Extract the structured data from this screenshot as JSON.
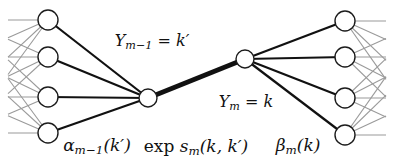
{
  "labels": {
    "y_prev": {
      "base": "Y",
      "sub": "m−1",
      "rest": " = k′"
    },
    "y_cur": {
      "base": "Y",
      "sub": "m",
      "rest": " = k"
    },
    "alpha": {
      "base": "α",
      "sub": "m−1",
      "rest": "(k′)"
    },
    "exp_s": {
      "prefix": "exp",
      "base": " s",
      "sub": "m",
      "rest": "(k, k′)"
    },
    "beta": {
      "base": "β",
      "sub": "m",
      "rest": "(k)"
    }
  },
  "graph": {
    "width": 393,
    "height": 165,
    "left_nodes": [
      {
        "x": 48,
        "y": 20
      },
      {
        "x": 48,
        "y": 57
      },
      {
        "x": 48,
        "y": 97
      },
      {
        "x": 48,
        "y": 133
      }
    ],
    "right_nodes": [
      {
        "x": 345,
        "y": 21
      },
      {
        "x": 345,
        "y": 57
      },
      {
        "x": 345,
        "y": 98
      },
      {
        "x": 345,
        "y": 135
      }
    ],
    "hub_left": {
      "x": 148,
      "y": 98
    },
    "hub_right": {
      "x": 245,
      "y": 59
    },
    "node_radius": 10,
    "hub_radius": 9,
    "left_virtual_x": -35,
    "left_cut_x": 8,
    "right_virtual_x": 425,
    "right_cut_x": 386,
    "colors": {
      "edge": "#111111",
      "fan": "#9a9a9a",
      "node_fill": "#ffffff",
      "node_stroke": "#1c1c1c",
      "background": "#ffffff"
    },
    "edge_width": 2.2,
    "bold_edge_width": 4.6,
    "fan_width": 1.1,
    "node_stroke_width": 1.4
  }
}
